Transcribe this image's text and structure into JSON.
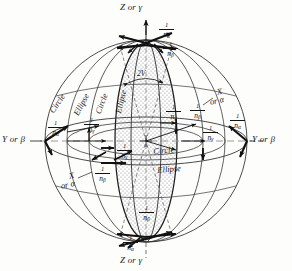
{
  "figure": {
    "type": "diagram",
    "background_color": "#fdfdfc",
    "line_color": "#1a1a1a",
    "shade_color": "#c9c9c9"
  },
  "axes": {
    "top": {
      "label": "Z or γ"
    },
    "bottom": {
      "label": "Z or γ"
    },
    "left": {
      "label": "Y or β"
    },
    "right": {
      "label": "Y or β"
    },
    "upper_right_diagonal": {
      "label_line1": "X",
      "label_line2": "or α"
    },
    "lower_left_diagonal": {
      "label_line1": "X",
      "label_line2": "or α"
    }
  },
  "angle": {
    "label": "2V"
  },
  "radii": [
    {
      "id": "top-alpha",
      "num": "1",
      "den": "n",
      "sub": "α"
    },
    {
      "id": "top-beta",
      "num": "1",
      "den": "n",
      "sub": "β"
    },
    {
      "id": "left-alpha",
      "num": "1",
      "den": "n",
      "sub": "α"
    },
    {
      "id": "left-gamma",
      "num": "1",
      "den": "n",
      "sub": "γ"
    },
    {
      "id": "mid-left-gamma",
      "num": "1",
      "den": "n",
      "sub": "γ"
    },
    {
      "id": "lower-left-beta",
      "num": "1",
      "den": "n",
      "sub": "β"
    },
    {
      "id": "mid-right-gamma",
      "num": "1",
      "den": "n",
      "sub": "γ"
    },
    {
      "id": "mid-right-beta",
      "num": "1",
      "den": "n",
      "sub": "β"
    },
    {
      "id": "right-gamma",
      "num": "1",
      "den": "n",
      "sub": "γ"
    },
    {
      "id": "right-alpha",
      "num": "1",
      "den": "n",
      "sub": "α"
    },
    {
      "id": "inner-beta",
      "num": "1",
      "den": "n",
      "sub": "β"
    },
    {
      "id": "bottom-beta",
      "num": "1",
      "den": "n",
      "sub": "β"
    },
    {
      "id": "bottom-alpha",
      "num": "1",
      "den": "n",
      "sub": "α"
    }
  ],
  "section_labels": [
    {
      "id": "left-outer",
      "text": "Circle"
    },
    {
      "id": "left-second",
      "text": "Ellipse"
    },
    {
      "id": "left-third",
      "text": "Circle"
    },
    {
      "id": "left-fourth",
      "text": "Ellipse"
    },
    {
      "id": "center-circle",
      "text": "Circle"
    },
    {
      "id": "center-ellipse",
      "text": "Ellipse"
    }
  ]
}
